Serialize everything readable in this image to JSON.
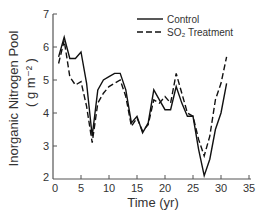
{
  "chart_data": {
    "type": "line",
    "title": "",
    "xlabel": "Time (yr)",
    "ylabel": "Inorganic Nitrogen Pool",
    "ylabel_units": "( g m⁻² )",
    "xlim": [
      0,
      35
    ],
    "ylim": [
      2,
      7
    ],
    "xticks": [
      0,
      5,
      10,
      15,
      20,
      25,
      30,
      35
    ],
    "yticks": [
      2,
      3,
      4,
      5,
      6,
      7
    ],
    "grid": false,
    "legend_position": "upper-right",
    "series": [
      {
        "name": "Control",
        "style": "solid",
        "x": [
          1,
          2,
          3,
          4,
          5,
          6,
          7,
          8,
          9,
          10,
          11,
          12,
          13,
          14,
          15,
          16,
          17,
          18,
          19,
          20,
          21,
          22,
          23,
          24,
          25,
          26,
          27,
          28,
          29,
          30,
          31
        ],
        "y": [
          5.7,
          6.3,
          5.65,
          5.65,
          5.85,
          4.9,
          3.3,
          4.7,
          5.0,
          5.1,
          5.2,
          5.2,
          4.7,
          3.7,
          3.9,
          3.4,
          3.7,
          4.7,
          4.4,
          4.1,
          4.1,
          4.8,
          4.3,
          3.9,
          3.9,
          2.9,
          2.1,
          2.6,
          3.5,
          4.0,
          4.9
        ]
      },
      {
        "name": "SO₂ Treatment",
        "style": "dashed",
        "x": [
          1,
          2,
          3,
          4,
          5,
          6,
          7,
          8,
          9,
          10,
          11,
          12,
          13,
          14,
          15,
          16,
          17,
          18,
          19,
          20,
          21,
          22,
          23,
          24,
          25,
          26,
          27,
          28,
          29,
          30,
          31
        ],
        "y": [
          5.5,
          6.2,
          5.1,
          4.85,
          4.95,
          4.2,
          3.1,
          4.3,
          4.6,
          4.8,
          4.9,
          5.0,
          4.5,
          3.6,
          3.85,
          3.45,
          3.65,
          4.4,
          4.3,
          4.5,
          4.3,
          5.2,
          4.6,
          4.0,
          3.9,
          3.2,
          2.7,
          3.3,
          4.4,
          4.9,
          5.7
        ]
      }
    ]
  },
  "legend": {
    "items": [
      {
        "label": "Control",
        "style": "solid"
      },
      {
        "label": "SO₂ Treatment",
        "style": "dashed"
      }
    ]
  }
}
